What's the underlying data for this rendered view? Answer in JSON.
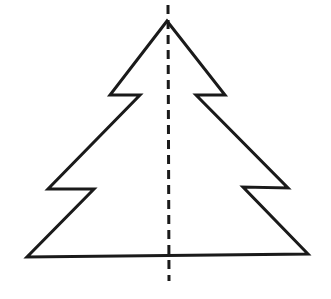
{
  "diagram": {
    "colors": {
      "stroke": "#1a1a1a",
      "background": "#ffffff"
    },
    "tree_points": "167,21 110,95 140,95 48,189 94,189 27,257 308,254 243,187 288,188 196,95 225,95 167,21",
    "axis": {
      "x1": 168,
      "y1": 5,
      "x2": 169,
      "y2": 281
    }
  }
}
